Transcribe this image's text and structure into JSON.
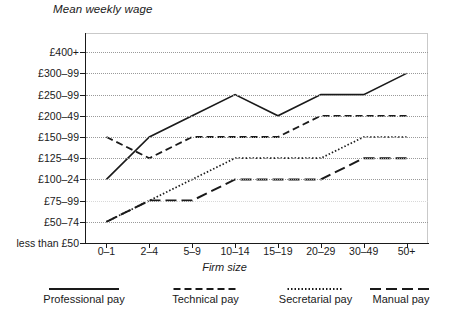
{
  "chart_data": {
    "type": "line",
    "title": "Mean weekly wage",
    "xlabel": "Firm size",
    "ylabel": "",
    "grid": true,
    "legend_position": "bottom",
    "categories": [
      "0–1",
      "2–4",
      "5–9",
      "10–14",
      "15–19",
      "20–29",
      "30–49",
      "50+"
    ],
    "y_categories": [
      "less than £50",
      "£50–74",
      "£75–99",
      "£100–24",
      "£125–49",
      "£150–99",
      "£200–49",
      "£250–99",
      "£300–99",
      "£400+"
    ],
    "series": [
      {
        "name": "Professional pay",
        "style": "solid",
        "values": [
          "£100–24",
          "£150–99",
          "£200–49",
          "£250–99",
          "£200–49",
          "£250–99",
          "£250–99",
          "£300–99"
        ],
        "level_index": [
          3,
          5,
          6,
          7,
          6,
          7,
          7,
          8
        ]
      },
      {
        "name": "Technical pay",
        "style": "dashed",
        "values": [
          "£150–99",
          "£125–49",
          "£150–99",
          "£150–99",
          "£150–99",
          "£200–49",
          "£200–49",
          "£200–49"
        ],
        "level_index": [
          5,
          4,
          5,
          5,
          5,
          6,
          6,
          6
        ]
      },
      {
        "name": "Secretarial pay",
        "style": "dotted",
        "values": [
          "£50–74",
          "£75–99",
          "£100–24",
          "£125–49",
          "£125–49",
          "£125–49",
          "£150–99",
          "£150–99"
        ],
        "level_index": [
          1,
          2,
          3,
          4,
          4,
          4,
          5,
          5
        ]
      },
      {
        "name": "Manual pay",
        "style": "long-dash",
        "values": [
          "£50–74",
          "£75–99",
          "£75–99",
          "£100–24",
          "£100–24",
          "£100–24",
          "£125–49",
          "£125–49"
        ],
        "level_index": [
          1,
          2,
          2,
          3,
          3,
          3,
          4,
          4
        ]
      }
    ]
  },
  "legend": {
    "items": [
      {
        "label": "Professional pay"
      },
      {
        "label": "Technical pay"
      },
      {
        "label": "Secretarial pay"
      },
      {
        "label": "Manual pay"
      }
    ]
  },
  "colors": {
    "line": "#1a1a1a",
    "grid": "#9a9a9a",
    "frame": "#c9c9c9",
    "background": "#ffffff"
  }
}
